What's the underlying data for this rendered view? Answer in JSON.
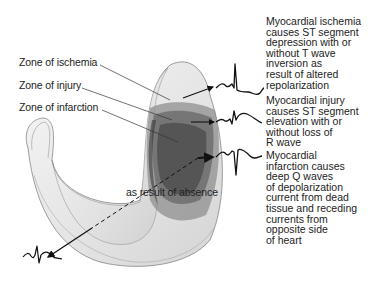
{
  "zone_labels": {
    "ischemia": "Zone of ischemia",
    "injury": "Zone of injury",
    "infarction": "Zone of infarction"
  },
  "inner_annotation": "as result of absence",
  "descriptions": {
    "ischemia": [
      "Myocardial ischemia",
      "causes ST segment",
      "depression with or",
      "without T wave",
      "inversion as",
      "result of altered",
      "repolarization"
    ],
    "injury": [
      "Myocardial injury",
      "causes ST segment",
      "elevation with or",
      "without loss of",
      "R wave"
    ],
    "infarction": [
      "Myocardial",
      "infarction causes",
      "deep Q waves",
      "of depolarization",
      "current from dead",
      "tissue and receding",
      "currents from",
      "opposite side",
      "of heart"
    ]
  },
  "waveforms": [
    "ecg-st-depression",
    "ecg-st-elevation",
    "ecg-deep-q-wave",
    "ecg-reciprocal"
  ],
  "colors": {
    "ischemia_zone": "#9a9a9a",
    "injury_zone": "#6e6e6e",
    "infarction_zone": "#555555",
    "myocardium": "#eeeeee"
  }
}
